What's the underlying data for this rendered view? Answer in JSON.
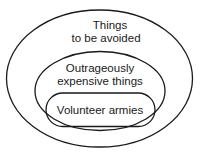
{
  "diagram": {
    "type": "nested-set (Euler diagram)",
    "sets": [
      {
        "id": "outer",
        "label_lines": [
          "Things",
          "to be avoided"
        ]
      },
      {
        "id": "middle",
        "label_lines": [
          "Outrageously",
          "expensive things"
        ]
      },
      {
        "id": "inner",
        "label_lines": [
          "Volunteer armies"
        ]
      }
    ],
    "colors": {
      "stroke": "#1a1a1a",
      "background": "#ffffff"
    }
  }
}
